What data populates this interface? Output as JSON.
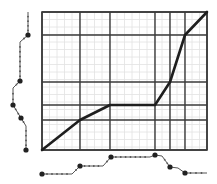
{
  "diagram": {
    "type": "dynamic-time-warping-alignment",
    "colors": {
      "background": "#ffffff",
      "major_grid": "#3a3a3a",
      "minor_grid": "#e2e2e2",
      "path": "#1e1e1e",
      "signal": "#555555",
      "marker": "#222222"
    },
    "grid": {
      "left": 42,
      "top": 12,
      "right": 207,
      "bottom": 150,
      "minor_step": 7.5,
      "major_vertical_x": [
        42,
        80,
        110,
        155,
        170,
        185,
        207
      ],
      "major_horizontal_y": [
        12,
        35,
        82,
        105,
        120,
        150
      ]
    },
    "warping_path": [
      [
        42,
        150
      ],
      [
        80,
        120
      ],
      [
        110,
        105
      ],
      [
        155,
        105
      ],
      [
        170,
        82
      ],
      [
        185,
        35
      ],
      [
        207,
        12
      ]
    ],
    "left_signal": {
      "path": [
        [
          28,
          12
        ],
        [
          28,
          35
        ],
        [
          20,
          42
        ],
        [
          20,
          81
        ],
        [
          13,
          88
        ],
        [
          13,
          105
        ],
        [
          21,
          118
        ],
        [
          26,
          126
        ],
        [
          26,
          150
        ]
      ],
      "markers": [
        [
          28,
          35
        ],
        [
          20,
          81
        ],
        [
          13,
          105
        ],
        [
          21,
          118
        ],
        [
          26,
          150
        ]
      ]
    },
    "bottom_signal": {
      "path": [
        [
          42,
          174
        ],
        [
          72,
          174
        ],
        [
          80,
          166
        ],
        [
          103,
          166
        ],
        [
          111,
          157
        ],
        [
          150,
          157
        ],
        [
          155,
          155
        ],
        [
          162,
          156
        ],
        [
          170,
          167
        ],
        [
          178,
          168
        ],
        [
          185,
          173
        ],
        [
          207,
          173
        ]
      ],
      "markers": [
        [
          42,
          174
        ],
        [
          80,
          166
        ],
        [
          111,
          157
        ],
        [
          155,
          155
        ],
        [
          170,
          167
        ],
        [
          185,
          173
        ]
      ]
    }
  }
}
